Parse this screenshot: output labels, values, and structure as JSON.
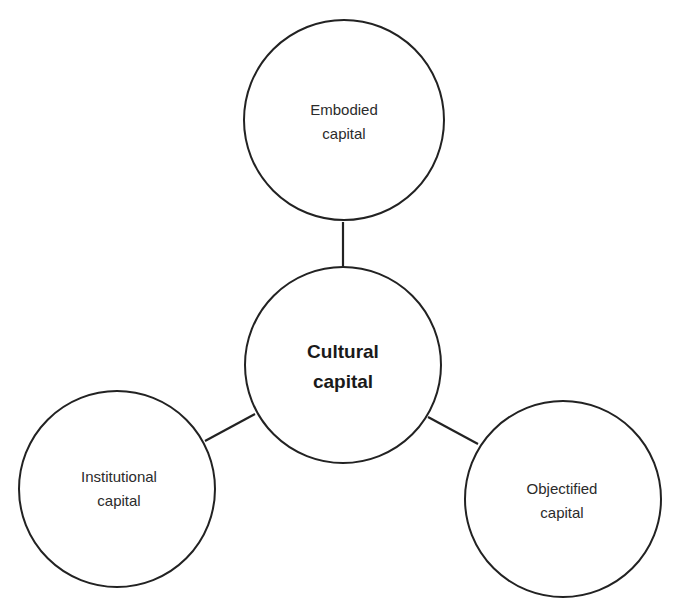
{
  "diagram": {
    "type": "hub-and-spoke",
    "stroke_color": "#222222",
    "background": "#ffffff",
    "center": {
      "id": "cultural",
      "lines": [
        "Cultural",
        "capital"
      ],
      "bold": true
    },
    "nodes": [
      {
        "id": "embodied",
        "lines": [
          "Embodied",
          "capital"
        ],
        "position": "top"
      },
      {
        "id": "institutional",
        "lines": [
          "Institutional",
          "capital"
        ],
        "position": "bottom-left"
      },
      {
        "id": "objectified",
        "lines": [
          "Objectified",
          "capital"
        ],
        "position": "bottom-right"
      }
    ],
    "edges": [
      {
        "from": "cultural",
        "to": "embodied"
      },
      {
        "from": "cultural",
        "to": "institutional"
      },
      {
        "from": "cultural",
        "to": "objectified"
      }
    ]
  }
}
